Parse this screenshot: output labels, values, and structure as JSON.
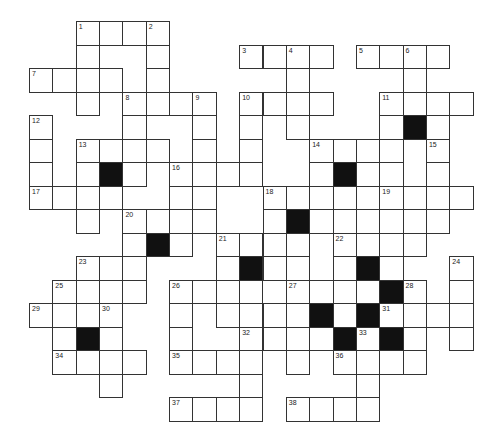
{
  "puzzle": {
    "type": "crossword",
    "origin": {
      "x": 29,
      "y": 21
    },
    "cell_w": 23.35,
    "cell_h": 23.5,
    "colors": {
      "line": "#333333",
      "fill": "#ffffff",
      "block": "#111111",
      "number": "#222222"
    },
    "rows": [
      {
        "r": 0,
        "cells": [
          2,
          3,
          4,
          5
        ],
        "black": [],
        "numbers": {
          "2": "1",
          "5": "2"
        }
      },
      {
        "r": 1,
        "cells": [
          2,
          5,
          9,
          10,
          11,
          12,
          14,
          15,
          16,
          17
        ],
        "black": [],
        "numbers": {
          "9": "3",
          "11": "4",
          "14": "5",
          "16": "6"
        }
      },
      {
        "r": 2,
        "cells": [
          0,
          1,
          2,
          3,
          5,
          11,
          16
        ],
        "black": [],
        "numbers": {
          "0": "7"
        }
      },
      {
        "r": 3,
        "cells": [
          2,
          4,
          5,
          6,
          7,
          9,
          10,
          11,
          12,
          15,
          16,
          17,
          18
        ],
        "black": [],
        "numbers": {
          "4": "8",
          "7": "9",
          "9": "10",
          "15": "11"
        }
      },
      {
        "r": 4,
        "cells": [
          0,
          4,
          7,
          9,
          11,
          15,
          17
        ],
        "black": [
          16
        ],
        "numbers": {
          "0": "12"
        }
      },
      {
        "r": 5,
        "cells": [
          0,
          2,
          3,
          4,
          5,
          7,
          9,
          12,
          13,
          14,
          15,
          17
        ],
        "black": [],
        "numbers": {
          "2": "13",
          "12": "14",
          "17": "15"
        }
      },
      {
        "r": 6,
        "cells": [
          0,
          2,
          4,
          6,
          7,
          8,
          9,
          12,
          14,
          15,
          17
        ],
        "black": [
          3,
          13
        ],
        "numbers": {
          "6": "16"
        }
      },
      {
        "r": 7,
        "cells": [
          0,
          1,
          2,
          3,
          6,
          7,
          10,
          11,
          12,
          13,
          15,
          16,
          17,
          18
        ],
        "black": [],
        "numbers": {
          "0": "17",
          "10": "18",
          "15": "19"
        }
      },
      {
        "r": 8,
        "cells": [
          2,
          4,
          5,
          6,
          7,
          10,
          12,
          13,
          14,
          15,
          16,
          17
        ],
        "black": [
          11
        ],
        "numbers": {
          "4": "20"
        }
      },
      {
        "r": 9,
        "cells": [
          4,
          6,
          8,
          9,
          10,
          11,
          13,
          14,
          15,
          16
        ],
        "black": [
          5
        ],
        "numbers": {
          "8": "21",
          "13": "22"
        }
      },
      {
        "r": 10,
        "cells": [
          2,
          3,
          4,
          8,
          10,
          11,
          13,
          15,
          18
        ],
        "black": [
          9,
          14
        ],
        "numbers": {
          "2": "23",
          "18": "24"
        }
      },
      {
        "r": 11,
        "cells": [
          1,
          2,
          3,
          4,
          6,
          7,
          8,
          9,
          11,
          12,
          13,
          14,
          16,
          18
        ],
        "black": [
          15
        ],
        "numbers": {
          "1": "25",
          "6": "26",
          "11": "27",
          "16": "28"
        }
      },
      {
        "r": 12,
        "cells": [
          0,
          1,
          2,
          3,
          6,
          8,
          9,
          10,
          11,
          13,
          15,
          16,
          17,
          18
        ],
        "black": [
          12,
          14
        ],
        "numbers": {
          "0": "29",
          "3": "30",
          "15": "31"
        }
      },
      {
        "r": 13,
        "cells": [
          1,
          3,
          6,
          9,
          10,
          11,
          12,
          14,
          16,
          18
        ],
        "black": [
          2,
          13,
          15
        ],
        "numbers": {
          "9": "32",
          "14": "33"
        }
      },
      {
        "r": 14,
        "cells": [
          1,
          2,
          3,
          4,
          6,
          7,
          8,
          9,
          11,
          13,
          14,
          15,
          16
        ],
        "black": [],
        "numbers": {
          "1": "34",
          "6": "35",
          "13": "36"
        }
      },
      {
        "r": 15,
        "cells": [
          3,
          9,
          14
        ],
        "black": [],
        "numbers": {}
      },
      {
        "r": 16,
        "cells": [
          6,
          7,
          8,
          9,
          11,
          12,
          13,
          14
        ],
        "black": [],
        "numbers": {
          "6": "37",
          "11": "38"
        }
      }
    ],
    "clue_numbers": [
      "1",
      "2",
      "3",
      "4",
      "5",
      "6",
      "7",
      "8",
      "9",
      "10",
      "11",
      "12",
      "13",
      "14",
      "15",
      "16",
      "17",
      "18",
      "19",
      "20",
      "21",
      "22",
      "23",
      "24",
      "25",
      "26",
      "27",
      "28",
      "29",
      "30",
      "31",
      "32",
      "33",
      "34",
      "35",
      "36",
      "37",
      "38"
    ]
  }
}
